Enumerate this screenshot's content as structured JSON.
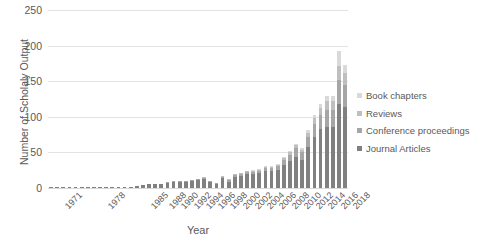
{
  "chart_data": {
    "type": "bar",
    "subtype": "stacked-bar",
    "title": "",
    "xlabel": "Year",
    "ylabel": "Number of Scholaly Output",
    "ylim": [
      0,
      250
    ],
    "yticks": [
      0,
      50,
      100,
      150,
      200,
      250
    ],
    "grid": true,
    "legend_position": "right",
    "categories": [
      "1971",
      "1972",
      "1973",
      "1974",
      "1975",
      "1976",
      "1977",
      "1978",
      "1979",
      "1980",
      "1981",
      "1982",
      "1983",
      "1984",
      "1985",
      "1986",
      "1987",
      "1988",
      "1989",
      "1990",
      "1991",
      "1992",
      "1993",
      "1994",
      "1995",
      "1996",
      "1997",
      "1998",
      "1999",
      "2000",
      "2001",
      "2002",
      "2003",
      "2004",
      "2005",
      "2006",
      "2007",
      "2008",
      "2009",
      "2010",
      "2011",
      "2012",
      "2013",
      "2014",
      "2015",
      "2016",
      "2017",
      "2018",
      "2019"
    ],
    "xtick_labels": [
      "1971",
      "1978",
      "1985",
      "1988",
      "1990",
      "1992",
      "1994",
      "1996",
      "1998",
      "2000",
      "2002",
      "2004",
      "2006",
      "2008",
      "2010",
      "2012",
      "2014",
      "2016",
      "2018"
    ],
    "xtick_indices": [
      0,
      7,
      14,
      17,
      19,
      21,
      23,
      25,
      27,
      29,
      31,
      33,
      35,
      37,
      39,
      41,
      43,
      45,
      47
    ],
    "series": [
      {
        "name": "Journal Articles",
        "color": "#808080",
        "values": [
          1,
          1,
          1,
          1,
          1,
          1,
          1,
          1,
          1,
          1,
          2,
          2,
          2,
          2,
          3,
          4,
          5,
          6,
          6,
          7,
          8,
          9,
          8,
          10,
          11,
          12,
          9,
          6,
          14,
          9,
          16,
          17,
          19,
          20,
          21,
          24,
          24,
          26,
          32,
          38,
          44,
          40,
          58,
          72,
          83,
          86,
          86,
          118,
          114
        ]
      },
      {
        "name": "Conference proceedings",
        "color": "#a6a6a6",
        "values": [
          0,
          0,
          0,
          0,
          0,
          0,
          0,
          0,
          0,
          0,
          0,
          0,
          0,
          0,
          0,
          0,
          0,
          0,
          0,
          1,
          1,
          1,
          1,
          1,
          1,
          2,
          1,
          1,
          2,
          2,
          2,
          3,
          3,
          3,
          3,
          4,
          4,
          5,
          7,
          9,
          12,
          10,
          14,
          18,
          20,
          24,
          24,
          34,
          30
        ]
      },
      {
        "name": "Reviews",
        "color": "#bfbfbf",
        "values": [
          0,
          0,
          0,
          0,
          0,
          0,
          0,
          0,
          0,
          0,
          0,
          0,
          0,
          0,
          0,
          0,
          0,
          0,
          0,
          0,
          0,
          0,
          0,
          0,
          0,
          1,
          0,
          0,
          1,
          1,
          1,
          1,
          1,
          1,
          2,
          2,
          2,
          2,
          3,
          3,
          4,
          4,
          6,
          8,
          10,
          12,
          12,
          20,
          18
        ]
      },
      {
        "name": "Book chapters",
        "color": "#d9d9d9",
        "values": [
          0,
          0,
          0,
          0,
          0,
          0,
          0,
          0,
          0,
          0,
          0,
          0,
          0,
          0,
          0,
          0,
          0,
          0,
          0,
          0,
          0,
          0,
          0,
          0,
          0,
          0,
          0,
          0,
          0,
          0,
          0,
          0,
          0,
          1,
          1,
          1,
          1,
          1,
          1,
          2,
          2,
          2,
          3,
          4,
          5,
          7,
          7,
          21,
          11
        ]
      }
    ],
    "totals": [
      1,
      1,
      1,
      1,
      1,
      1,
      1,
      1,
      1,
      1,
      2,
      2,
      2,
      2,
      3,
      4,
      5,
      6,
      6,
      8,
      9,
      10,
      9,
      11,
      12,
      15,
      10,
      7,
      17,
      12,
      19,
      21,
      23,
      25,
      27,
      31,
      31,
      34,
      43,
      52,
      62,
      56,
      81,
      102,
      118,
      129,
      129,
      193,
      173
    ]
  },
  "legend": {
    "entries": [
      {
        "label": "Book chapters",
        "color": "#d9d9d9"
      },
      {
        "label": "Reviews",
        "color": "#bfbfbf"
      },
      {
        "label": "Conference proceedings",
        "color": "#a6a6a6"
      },
      {
        "label": "Journal Articles",
        "color": "#808080"
      }
    ]
  },
  "axes": {
    "y_title": "Number of Scholaly Output",
    "x_title": "Year"
  },
  "colors": {
    "gridline": "#e3e3e3",
    "text": "#595959",
    "background": "#ffffff"
  }
}
